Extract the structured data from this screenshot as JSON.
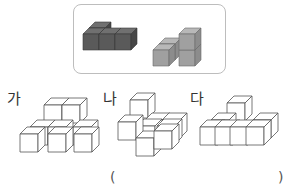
{
  "given_pieces": {
    "piece_1": {
      "color": "#5a5a5a",
      "description": "dark gray 4-cube L-shaped piece"
    },
    "piece_2": {
      "color": "#9e9e9e",
      "description": "light gray 4-cube piece with tower"
    }
  },
  "options": [
    {
      "label": "가"
    },
    {
      "label": "나"
    },
    {
      "label": "다"
    }
  ],
  "answer": {
    "open_paren": "(",
    "close_paren": ")",
    "value": ""
  },
  "colors": {
    "border": "#bdbdbd",
    "cube_line": "#555555",
    "dark_top": "#6e6e6e",
    "dark_front": "#555555",
    "dark_side": "#444444",
    "light_top": "#b4b4b4",
    "light_front": "#9e9e9e",
    "light_side": "#8a8a8a"
  }
}
